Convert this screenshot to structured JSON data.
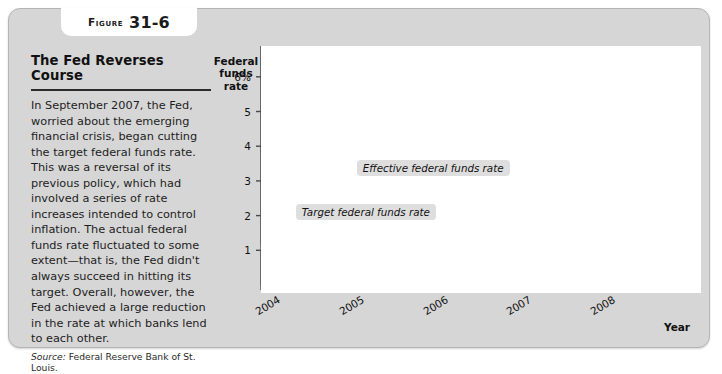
{
  "figure": {
    "badge_word": "Figure",
    "badge_number": "31-6",
    "headline": "The Fed Reverses Course",
    "body": "In September 2007, the Fed, worried about the emerging financial crisis, began cutting the target federal funds rate. This was a reversal of its previous policy, which had involved a series of rate increases intended to control inflation. The actual federal funds rate fluctuated to some extent—that is, the Fed didn't always succeed in hitting its target. Overall, however, the Fed achieved a large reduction in the rate at which banks lend to each other.",
    "source_label": "Source:",
    "source_text": "Federal Reserve Bank of St. Louis."
  },
  "chart_data": {
    "type": "line",
    "title": "The Fed Reverses Course",
    "xlabel": "Year",
    "ylabel": "Federal funds rate",
    "xlim": [
      2004.0,
      2009.25
    ],
    "ylim": [
      0,
      6.6
    ],
    "yticks": [
      1,
      2,
      3,
      4,
      5,
      6
    ],
    "ytick_labels": [
      "1",
      "2",
      "3",
      "4",
      "5",
      "6%"
    ],
    "xticks": [
      2004,
      2005,
      2006,
      2007,
      2008
    ],
    "xtick_labels": [
      "2004",
      "2005",
      "2006",
      "2007",
      "2008"
    ],
    "grid": false,
    "legend_position": "annotations",
    "annotations": [
      {
        "name": "effective-rate-label",
        "text": "Effective federal funds rate",
        "x": 2006.55,
        "y": 3.35
      },
      {
        "name": "target-rate-label",
        "text": "Target federal funds rate",
        "x": 2005.75,
        "y": 2.08
      }
    ],
    "series": [
      {
        "name": "Target federal funds rate",
        "color": "#1a1a1a",
        "style": "step",
        "x": [
          2004.0,
          2004.5,
          2004.5,
          2004.63,
          2004.63,
          2004.75,
          2004.75,
          2004.88,
          2004.88,
          2005.0,
          2005.0,
          2005.17,
          2005.17,
          2005.33,
          2005.33,
          2005.5,
          2005.5,
          2005.6,
          2005.6,
          2005.75,
          2005.75,
          2005.92,
          2005.92,
          2006.08,
          2006.08,
          2006.21,
          2006.21,
          2006.33,
          2006.33,
          2006.46,
          2006.46,
          2007.67,
          2007.67,
          2007.8,
          2007.8,
          2007.95,
          2007.95,
          2008.06,
          2008.06,
          2008.14,
          2008.14,
          2008.22,
          2008.22,
          2008.33,
          2008.33,
          2008.79,
          2008.79,
          2008.88,
          2008.88,
          2008.96,
          2008.96,
          2009.25
        ],
        "y": [
          1.0,
          1.0,
          1.25,
          1.25,
          1.5,
          1.5,
          1.75,
          1.75,
          2.0,
          2.0,
          2.25,
          2.25,
          2.5,
          2.5,
          2.75,
          2.75,
          3.0,
          3.0,
          3.25,
          3.25,
          3.5,
          3.5,
          3.75,
          3.75,
          4.25,
          4.25,
          4.75,
          4.75,
          5.0,
          5.0,
          5.25,
          5.25,
          4.75,
          4.75,
          4.5,
          4.5,
          4.25,
          4.25,
          3.5,
          3.5,
          3.0,
          3.0,
          2.25,
          2.25,
          2.0,
          2.0,
          1.5,
          1.5,
          1.0,
          1.0,
          0.25,
          0.25
        ]
      },
      {
        "name": "Effective federal funds rate",
        "color": "#9a9a9a",
        "style": "noisy-line",
        "description": "Daily effective rate tracking the target with volatility; spikes and dips around target changes, falling below target in late 2008 and ending near 0.15."
      }
    ]
  },
  "axis_titles": {
    "y": "Federal\nfunds\nrate",
    "x": "Year"
  }
}
